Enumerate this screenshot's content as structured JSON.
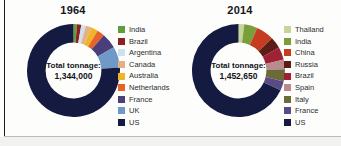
{
  "figure": {
    "cut_off_title": "",
    "background": "#fdfdfc"
  },
  "panels": [
    {
      "id": "1964",
      "year": "1964",
      "center_line1": "Total tonnage:",
      "center_line2": "1,344,000"
    },
    {
      "id": "2014",
      "year": "2014",
      "center_line1": "Total tonnage:",
      "center_line2": "1,452,650"
    }
  ],
  "legend_1964": [
    {
      "label": "India",
      "color": "#5f9e3f"
    },
    {
      "label": "Brazil",
      "color": "#8e1f22"
    },
    {
      "label": "Argentina",
      "color": "#cfe0ef"
    },
    {
      "label": "Canada",
      "color": "#e3b185"
    },
    {
      "label": "Australia",
      "color": "#f0b429"
    },
    {
      "label": "Netherlands",
      "color": "#e8622a"
    },
    {
      "label": "France",
      "color": "#4b3f7a"
    },
    {
      "label": "UK",
      "color": "#6f9ac8"
    },
    {
      "label": "US",
      "color": "#141a40"
    }
  ],
  "legend_2014": [
    {
      "label": "Thailand",
      "color": "#c6d69a"
    },
    {
      "label": "India",
      "color": "#7a9e3c"
    },
    {
      "label": "China",
      "color": "#c63c20"
    },
    {
      "label": "Russia",
      "color": "#5c1d16"
    },
    {
      "label": "Brazil",
      "color": "#9e2233"
    },
    {
      "label": "Spain",
      "color": "#b98a8e"
    },
    {
      "label": "Italy",
      "color": "#6d6a3a"
    },
    {
      "label": "France",
      "color": "#5a4b86"
    },
    {
      "label": "US",
      "color": "#141a40"
    }
  ],
  "chart_data": [
    {
      "type": "pie",
      "title": "1964",
      "subtitle": "Total tonnage: 1,344,000",
      "total_tonnage": 1344000,
      "donut": true,
      "inner_radius_ratio": 0.6,
      "start_angle_deg": -90,
      "direction": "clockwise",
      "legend_position": "right",
      "categories": [
        "India",
        "Brazil",
        "Argentina",
        "Canada",
        "Australia",
        "Netherlands",
        "France",
        "UK",
        "US"
      ],
      "values": [
        1.2,
        1.5,
        1.6,
        2.0,
        2.4,
        2.6,
        5.4,
        7.3,
        76.0
      ],
      "value_unit": "percent of total tonnage",
      "colors": [
        "#5f9e3f",
        "#8e1f22",
        "#cfe0ef",
        "#e3b185",
        "#f0b429",
        "#e8622a",
        "#4b3f7a",
        "#6f9ac8",
        "#141a40"
      ]
    },
    {
      "type": "pie",
      "title": "2014",
      "subtitle": "Total tonnage: 1,452,650",
      "total_tonnage": 1452650,
      "donut": true,
      "inner_radius_ratio": 0.6,
      "start_angle_deg": -90,
      "direction": "clockwise",
      "legend_position": "right",
      "categories": [
        "Thailand",
        "India",
        "China",
        "Russia",
        "Brazil",
        "Spain",
        "Italy",
        "France",
        "US"
      ],
      "values": [
        2.0,
        4.6,
        6.2,
        4.0,
        4.4,
        3.4,
        4.2,
        3.2,
        68.0
      ],
      "value_unit": "percent of total tonnage",
      "colors": [
        "#c6d69a",
        "#7a9e3c",
        "#c63c20",
        "#5c1d16",
        "#9e2233",
        "#b98a8e",
        "#6d6a3a",
        "#5a4b86",
        "#141a40"
      ]
    }
  ]
}
